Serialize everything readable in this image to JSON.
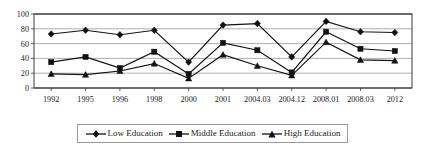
{
  "chart_data": {
    "type": "line",
    "title": "",
    "xlabel": "",
    "ylabel": "",
    "ylim": [
      0,
      100
    ],
    "yticks": [
      0,
      20,
      40,
      60,
      80,
      100
    ],
    "grid": true,
    "legend_position": "bottom",
    "categories": [
      "1992",
      "1995",
      "1996",
      "1998",
      "2000",
      "2001",
      "2004.03",
      "2004.12",
      "2008.01",
      "2008.03",
      "2012"
    ],
    "series": [
      {
        "name": "Low Education",
        "marker": "diamond",
        "color": "#111111",
        "values": [
          73,
          78,
          72,
          78,
          35,
          85,
          87,
          42,
          90,
          76,
          75
        ]
      },
      {
        "name": "Middle Education",
        "marker": "square",
        "color": "#111111",
        "values": [
          35,
          42,
          27,
          49,
          19,
          61,
          51,
          21,
          76,
          53,
          50
        ]
      },
      {
        "name": "High Education",
        "marker": "triangle",
        "color": "#111111",
        "values": [
          19,
          18,
          23,
          33,
          13,
          45,
          30,
          17,
          62,
          38,
          37
        ]
      }
    ]
  },
  "legend": {
    "entries": [
      {
        "label": "Low Education",
        "marker": "diamond"
      },
      {
        "label": "Middle Education",
        "marker": "square"
      },
      {
        "label": "High Education",
        "marker": "triangle"
      }
    ]
  }
}
